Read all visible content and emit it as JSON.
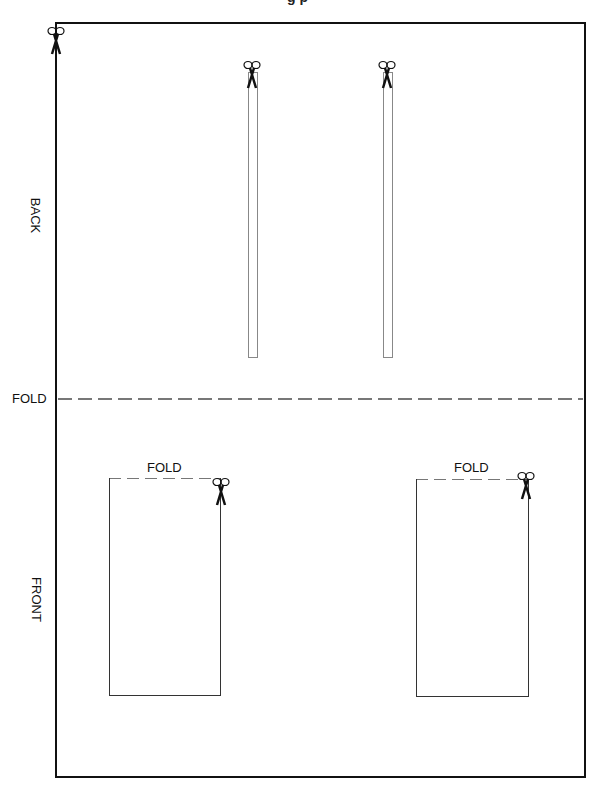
{
  "page": {
    "title_partial": "g    p",
    "sections": [
      {
        "label": "BACK"
      },
      {
        "label": "FRONT"
      }
    ],
    "main_fold": {
      "label": "FOLD"
    },
    "pockets": [
      {
        "fold_label": "FOLD"
      },
      {
        "fold_label": "FOLD"
      }
    ],
    "icons": {
      "scissors": "scissors-icon"
    },
    "colors": {
      "border": "#111111",
      "dash": "#777777",
      "strip": "#888888"
    }
  }
}
